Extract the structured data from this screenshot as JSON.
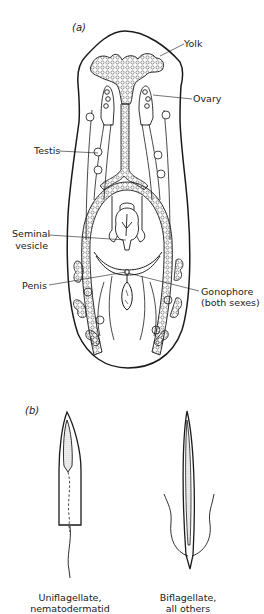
{
  "figure": {
    "panel_a": {
      "label": "(a)",
      "subject": "flatworm reproductive system",
      "annotations": [
        {
          "id": "yolk",
          "text": "Yolk"
        },
        {
          "id": "ovary",
          "text": "Ovary"
        },
        {
          "id": "testis",
          "text": "Testis"
        },
        {
          "id": "seminal_vesicle",
          "line1": "Seminal",
          "line2": "vesicle"
        },
        {
          "id": "penis",
          "text": "Penis"
        },
        {
          "id": "gonophore",
          "line1": "Gonophore",
          "line2": "(both sexes)"
        }
      ]
    },
    "panel_b": {
      "label": "(b)",
      "captions": [
        {
          "id": "uniflagellate",
          "line1": "Uniflagellate,",
          "line2": "nematodermatid"
        },
        {
          "id": "biflagellate",
          "line1": "Biflagellate,",
          "line2": "all others"
        }
      ]
    },
    "colors": {
      "ink": "#1a1a1a",
      "shade": "#bdbdbd",
      "background": "#ffffff"
    }
  }
}
